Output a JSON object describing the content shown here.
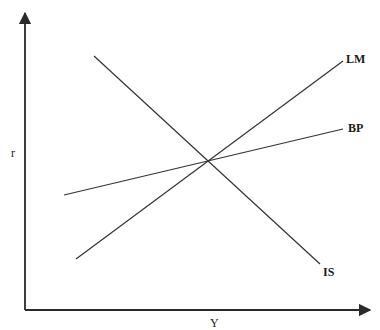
{
  "diagram": {
    "axes": {
      "x_label": "Y",
      "y_label": "r"
    },
    "curves": [
      {
        "id": "is",
        "label": "IS",
        "slope": "downward"
      },
      {
        "id": "lm",
        "label": "LM",
        "slope": "upward-steep"
      },
      {
        "id": "bp",
        "label": "BP",
        "slope": "upward-flat"
      }
    ],
    "equilibrium": "IS, LM and BP intersect at a single point"
  },
  "colors": {
    "line": "#333333",
    "axis": "#2a2a2a",
    "background": "#ffffff"
  }
}
